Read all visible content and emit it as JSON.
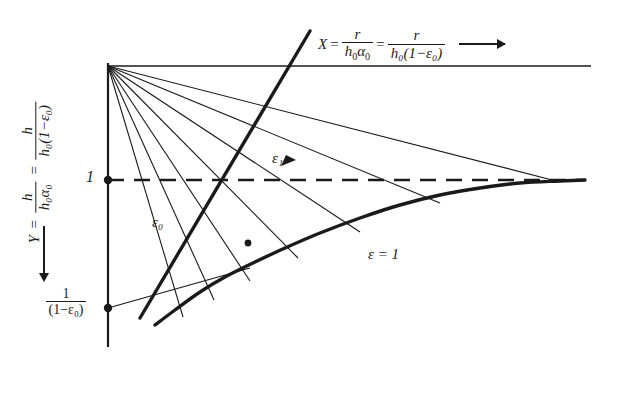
{
  "figure": {
    "type": "line-diagram",
    "background": "#ffffff",
    "ink_color": "#1a1a1a"
  },
  "axes": {
    "x_label": {
      "symbol": "X",
      "equals": "=",
      "expr1_num": "r",
      "expr1_den_h": "h",
      "expr1_den_sub": "0",
      "expr1_den_alpha": "α",
      "expr1_den_alpha_sub": "0",
      "equals2": "=",
      "expr2_num": "r",
      "expr2_den": "h₀(1−ε₀)",
      "arrow": "→",
      "full_text": "X = r/(h₀α₀) = r/(h₀(1−ε₀))"
    },
    "y_label": {
      "symbol": "Y",
      "equals": "=",
      "expr1_num": "h",
      "expr1_den": "h₀α₀",
      "equals2": "=",
      "expr2_num": "h",
      "expr2_den": "h₀(1−ε₀)",
      "arrow": "↓",
      "full_text": "Y = h/(h₀α₀) = h/(h₀(1−ε₀))"
    },
    "y_ticks": [
      {
        "id": "one",
        "label": "1",
        "pixel_y": 180
      },
      {
        "id": "one-over-one-minus-eps0",
        "num": "1",
        "den": "(1−ε₀)",
        "label": "1/(1−ε₀)",
        "pixel_y": 308
      }
    ]
  },
  "annotations": {
    "eps0": "ε₀",
    "eps1": "ε₁",
    "eps_equals_one": "ε = 1"
  },
  "chart_data": {
    "type": "line",
    "title": "",
    "xlabel": "X = r/(h₀α₀) = r/(h₀(1−ε₀))",
    "ylabel": "Y = h/(h₀α₀) = h/(h₀(1−ε₀))",
    "grid": false,
    "legend": "none",
    "y_axis_inverted": true,
    "axis_frame": {
      "y_axis_x": 108,
      "y_axis_top": 63,
      "y_axis_bottom": 347,
      "top_rule_y": 66,
      "top_rule_x1": 108,
      "top_rule_x2": 591
    },
    "reference_lines": [
      {
        "name": "asymptote-Y-equals-1",
        "style": "dashed",
        "y_value": 1,
        "pixel_y": 180,
        "x_start": 108,
        "x_end": 585
      }
    ],
    "series": [
      {
        "name": "eps-equals-1-envelope",
        "role": "thick-asymptotic-curve",
        "style": "solid-thick",
        "points": [
          [
            155,
            325
          ],
          [
            175,
            310
          ],
          [
            200,
            292
          ],
          [
            225,
            277
          ],
          [
            255,
            262
          ],
          [
            285,
            248
          ],
          [
            320,
            233
          ],
          [
            360,
            218
          ],
          [
            400,
            205
          ],
          [
            440,
            195
          ],
          [
            480,
            188
          ],
          [
            520,
            183
          ],
          [
            560,
            181
          ],
          [
            585,
            180
          ]
        ]
      },
      {
        "name": "eps1-ray",
        "role": "thick-straight-line",
        "style": "solid-thick",
        "points": [
          [
            140,
            318
          ],
          [
            310,
            31
          ]
        ],
        "arrow_marker_at": [
          287,
          163
        ]
      },
      {
        "name": "eps0-ray",
        "role": "thin-line-from-lower-tick",
        "style": "solid-thin",
        "points": [
          [
            108,
            308
          ],
          [
            250,
            268
          ]
        ]
      }
    ],
    "fan_lines": {
      "name": "constant-eps-rays",
      "origin": [
        108,
        66
      ],
      "count": 7,
      "style": "solid-thin",
      "endpoints": [
        [
          183,
          317
        ],
        [
          214,
          300
        ],
        [
          250,
          281
        ],
        [
          298,
          258
        ],
        [
          360,
          232
        ],
        [
          440,
          203
        ],
        [
          556,
          181
        ]
      ]
    },
    "markers": [
      {
        "name": "tick-dot-one",
        "x": 108,
        "y": 180
      },
      {
        "name": "tick-dot-lower",
        "x": 108,
        "y": 308
      },
      {
        "name": "curve-dot",
        "x": 248,
        "y": 243
      }
    ]
  }
}
